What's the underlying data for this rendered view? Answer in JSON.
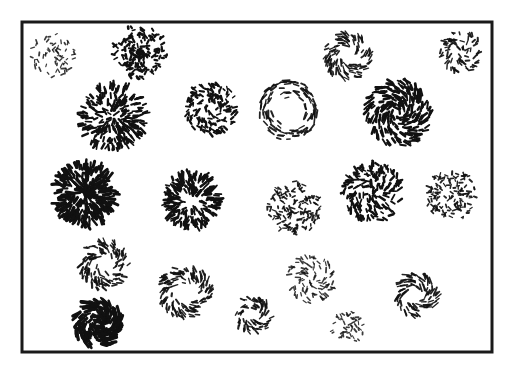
{
  "figure": {
    "title": "Array of circular texture patches composed of short oriented line elements",
    "background_color": "#ffffff",
    "ink_color": "#111111",
    "canvas": {
      "width": 516,
      "height": 372
    }
  },
  "frame": {
    "name": "outer-frame",
    "x": 22,
    "y": 22,
    "width": 470,
    "height": 330,
    "stroke_width": 3,
    "color": "#1a1a1a"
  },
  "render_params": {
    "seed": 20240917,
    "default_stroke_width": 1.6,
    "default_dash_length": 5.0
  },
  "patches": [
    {
      "id": "patch-r1-c1",
      "label": "sparse random speckle patch, upper left",
      "cx": 53,
      "cy": 55,
      "radius": 22,
      "pattern": "random",
      "count": 62,
      "dash_length": 3.0,
      "stroke_width": 1.5,
      "density_profile": "uniform",
      "hollow_ratio": 0.0,
      "jitter": 0.55,
      "size_class": "small",
      "darkness": "light"
    },
    {
      "id": "patch-r1-c2",
      "label": "dense random speckle patch with dark core, upper left-center",
      "cx": 140,
      "cy": 52,
      "radius": 27,
      "pattern": "random",
      "count": 150,
      "dash_length": 3.2,
      "stroke_width": 1.7,
      "density_profile": "center-heavy",
      "hollow_ratio": 0.0,
      "jitter": 0.6,
      "size_class": "medium",
      "darkness": "dark"
    },
    {
      "id": "patch-r1-c3",
      "label": "spiral pinwheel patch, upper right-center",
      "cx": 348,
      "cy": 56,
      "radius": 24,
      "pattern": "spiral",
      "spiral_pitch": 38,
      "count": 105,
      "dash_length": 5.0,
      "stroke_width": 1.5,
      "density_profile": "ring",
      "hollow_ratio": 0.22,
      "jitter": 0.22,
      "size_class": "medium",
      "darkness": "medium"
    },
    {
      "id": "patch-r1-c4",
      "label": "small spiral patch, upper right corner",
      "cx": 461,
      "cy": 52,
      "radius": 21,
      "pattern": "spiral",
      "spiral_pitch": 50,
      "count": 78,
      "dash_length": 3.6,
      "stroke_width": 1.5,
      "density_profile": "uniform",
      "hollow_ratio": 0.15,
      "jitter": 0.45,
      "size_class": "small",
      "darkness": "medium"
    },
    {
      "id": "patch-r2-c1",
      "label": "large dense radial starburst patch, second row left",
      "cx": 113,
      "cy": 117,
      "radius": 34,
      "pattern": "radial",
      "count": 230,
      "dash_length": 5.0,
      "stroke_width": 1.8,
      "density_profile": "uniform",
      "hollow_ratio": 0.0,
      "jitter": 0.3,
      "size_class": "large",
      "darkness": "dark"
    },
    {
      "id": "patch-r2-c2",
      "label": "medium mottled spiral patch, second row center-left",
      "cx": 211,
      "cy": 108,
      "radius": 27,
      "pattern": "spiral",
      "spiral_pitch": 42,
      "count": 150,
      "dash_length": 3.4,
      "stroke_width": 1.6,
      "density_profile": "uniform",
      "hollow_ratio": 0.0,
      "jitter": 0.55,
      "size_class": "medium",
      "darkness": "dark"
    },
    {
      "id": "patch-r2-c3",
      "label": "annulus ring patch with hollow center, second row center",
      "cx": 288,
      "cy": 110,
      "radius": 30,
      "pattern": "concentric",
      "count": 110,
      "dash_length": 5.4,
      "stroke_width": 1.5,
      "density_profile": "ring",
      "hollow_ratio": 0.4,
      "jitter": 0.18,
      "size_class": "medium",
      "darkness": "medium"
    },
    {
      "id": "patch-r2-c4",
      "label": "large dense spiral vortex patch, second row right",
      "cx": 398,
      "cy": 113,
      "radius": 33,
      "pattern": "spiral",
      "spiral_pitch": 34,
      "count": 235,
      "dash_length": 5.2,
      "stroke_width": 1.9,
      "density_profile": "uniform",
      "hollow_ratio": 0.05,
      "jitter": 0.22,
      "size_class": "large",
      "darkness": "dark"
    },
    {
      "id": "patch-r3-c1",
      "label": "very dense radial patch with dark rim, third row left",
      "cx": 85,
      "cy": 194,
      "radius": 32,
      "pattern": "radial",
      "count": 240,
      "dash_length": 6.0,
      "stroke_width": 2.0,
      "density_profile": "uniform",
      "hollow_ratio": 0.0,
      "jitter": 0.28,
      "size_class": "large",
      "darkness": "very-dark"
    },
    {
      "id": "patch-r3-c2",
      "label": "radial starburst patch with dotted core, third row center-left",
      "cx": 192,
      "cy": 200,
      "radius": 29,
      "pattern": "radial",
      "count": 195,
      "dash_length": 5.2,
      "stroke_width": 1.8,
      "density_profile": "ring",
      "hollow_ratio": 0.18,
      "jitter": 0.3,
      "size_class": "medium",
      "darkness": "dark"
    },
    {
      "id": "patch-r3-c3",
      "label": "fine stippled patch, third row center",
      "cx": 294,
      "cy": 208,
      "radius": 27,
      "pattern": "random",
      "count": 145,
      "dash_length": 3.0,
      "stroke_width": 1.5,
      "density_profile": "uniform",
      "hollow_ratio": 0.0,
      "jitter": 0.6,
      "size_class": "medium",
      "darkness": "medium"
    },
    {
      "id": "patch-r3-c4",
      "label": "spiral patch with mixed orientations, third row right-center",
      "cx": 372,
      "cy": 192,
      "radius": 30,
      "pattern": "spiral",
      "spiral_pitch": 55,
      "count": 175,
      "dash_length": 4.4,
      "stroke_width": 1.7,
      "density_profile": "uniform",
      "hollow_ratio": 0.0,
      "jitter": 0.5,
      "size_class": "medium",
      "darkness": "dark"
    },
    {
      "id": "patch-r3-c5",
      "label": "stippled speckle patch, third row right edge",
      "cx": 452,
      "cy": 196,
      "radius": 26,
      "pattern": "random",
      "count": 130,
      "dash_length": 3.0,
      "stroke_width": 1.5,
      "density_profile": "uniform",
      "hollow_ratio": 0.0,
      "jitter": 0.62,
      "size_class": "medium",
      "darkness": "medium"
    },
    {
      "id": "patch-r4-c1",
      "label": "spiral ring patch, fourth row left",
      "cx": 104,
      "cy": 265,
      "radius": 25,
      "pattern": "spiral",
      "spiral_pitch": 45,
      "count": 118,
      "dash_length": 4.4,
      "stroke_width": 1.6,
      "density_profile": "ring",
      "hollow_ratio": 0.28,
      "jitter": 0.35,
      "size_class": "medium",
      "darkness": "medium"
    },
    {
      "id": "patch-r4-c2",
      "label": "spiral ring patch with open center, fourth row center-left",
      "cx": 185,
      "cy": 292,
      "radius": 27,
      "pattern": "spiral",
      "spiral_pitch": 40,
      "count": 128,
      "dash_length": 4.6,
      "stroke_width": 1.6,
      "density_profile": "ring",
      "hollow_ratio": 0.3,
      "jitter": 0.28,
      "size_class": "medium",
      "darkness": "medium"
    },
    {
      "id": "patch-r4-c3",
      "label": "small spiral patch, fourth row center",
      "cx": 253,
      "cy": 315,
      "radius": 19,
      "pattern": "spiral",
      "spiral_pitch": 38,
      "count": 70,
      "dash_length": 4.0,
      "stroke_width": 1.6,
      "density_profile": "ring",
      "hollow_ratio": 0.22,
      "jitter": 0.3,
      "size_class": "small",
      "darkness": "medium"
    },
    {
      "id": "patch-r4-c4",
      "label": "sparse spiral patch, fourth row center-right",
      "cx": 311,
      "cy": 279,
      "radius": 24,
      "pattern": "spiral",
      "spiral_pitch": 48,
      "count": 92,
      "dash_length": 3.6,
      "stroke_width": 1.5,
      "density_profile": "uniform",
      "hollow_ratio": 0.12,
      "jitter": 0.45,
      "size_class": "medium",
      "darkness": "light"
    },
    {
      "id": "patch-r4-c5",
      "label": "curved spiral patch, fourth row right",
      "cx": 416,
      "cy": 295,
      "radius": 23,
      "pattern": "spiral",
      "spiral_pitch": 33,
      "count": 86,
      "dash_length": 5.4,
      "stroke_width": 1.6,
      "density_profile": "ring",
      "hollow_ratio": 0.25,
      "jitter": 0.2,
      "size_class": "medium",
      "darkness": "medium"
    },
    {
      "id": "patch-r5-c1",
      "label": "dense dark spiral vortex patch, bottom left",
      "cx": 98,
      "cy": 323,
      "radius": 25,
      "pattern": "spiral",
      "spiral_pitch": 28,
      "count": 175,
      "dash_length": 6.0,
      "stroke_width": 2.0,
      "density_profile": "uniform",
      "hollow_ratio": 0.05,
      "jitter": 0.18,
      "size_class": "medium",
      "darkness": "very-dark"
    },
    {
      "id": "patch-r5-c2",
      "label": "small sparse dot patch, bottom center-right",
      "cx": 348,
      "cy": 327,
      "radius": 17,
      "pattern": "random",
      "count": 46,
      "dash_length": 2.6,
      "stroke_width": 1.6,
      "density_profile": "uniform",
      "hollow_ratio": 0.0,
      "jitter": 0.65,
      "size_class": "small",
      "darkness": "light"
    },
    {
      "id": "patch-r2-c0",
      "label": "small faint speckle patch, upper area right of center-left",
      "cx": 231,
      "cy": 93,
      "radius": 0,
      "pattern": "random",
      "count": 0,
      "dash_length": 3.0,
      "stroke_width": 1.5,
      "density_profile": "uniform",
      "hollow_ratio": 0.0,
      "jitter": 0.6,
      "size_class": "none",
      "darkness": "none"
    }
  ],
  "legend": {
    "visible": false,
    "entries": []
  },
  "axes": {
    "visible": false
  }
}
